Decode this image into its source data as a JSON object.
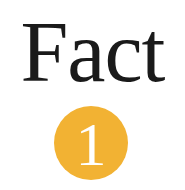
{
  "title": "Fact",
  "badge": {
    "number": "1",
    "color": "#F2B233",
    "text_color": "#FFFFFF"
  },
  "colors": {
    "title_text": "#1A1A1A",
    "background": "#FFFFFF"
  }
}
